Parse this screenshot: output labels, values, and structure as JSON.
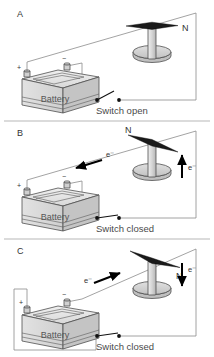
{
  "figure": {
    "background_color": "#ffffff",
    "panel_count": 3
  },
  "panels": [
    {
      "letter": "A",
      "switch_label": "Switch open",
      "switch_state": "open",
      "battery_label": "Battery",
      "positive_terminal": "+",
      "negative_terminal": "−",
      "compass_north_label": "N",
      "compass_needle_orientation": "horizontal",
      "wire_current_label": "",
      "external_arrow_label": "",
      "external_arrow_direction": "none"
    },
    {
      "letter": "B",
      "switch_label": "Switch closed",
      "switch_state": "closed",
      "battery_label": "Battery",
      "positive_terminal": "+",
      "negative_terminal": "−",
      "compass_north_label": "N",
      "compass_needle_orientation": "deflected-left",
      "wire_current_label": "e⁻",
      "wire_arrow_direction": "left",
      "external_arrow_label": "e⁻",
      "external_arrow_direction": "up"
    },
    {
      "letter": "C",
      "switch_label": "Switch closed",
      "switch_state": "closed",
      "battery_label": "Battery",
      "positive_terminal": "+",
      "negative_terminal": "−",
      "compass_north_label": "N",
      "compass_needle_orientation": "deflected-right",
      "wire_current_label": "e⁻",
      "wire_arrow_direction": "right",
      "external_arrow_label": "e⁻",
      "external_arrow_direction": "down"
    }
  ],
  "colors": {
    "wire": "#8c8c8c",
    "outline": "#4f4f4f",
    "needle": "#1a1a1a",
    "text": "#333333",
    "caption": "#4a4a4a",
    "battery_body": "#d9d9d9",
    "battery_top": "#ebebeb",
    "battery_side": "#bdbdbd",
    "stand": "#d0d0d0",
    "divider": "#9a9a9a"
  }
}
